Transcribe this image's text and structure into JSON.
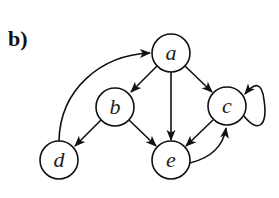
{
  "panel": {
    "label": "b)"
  },
  "graph": {
    "directed": true,
    "nodes": [
      {
        "id": "a",
        "label": "a",
        "x": 171,
        "y": 53
      },
      {
        "id": "b",
        "label": "b",
        "x": 115,
        "y": 107
      },
      {
        "id": "c",
        "label": "c",
        "x": 227,
        "y": 106
      },
      {
        "id": "d",
        "label": "d",
        "x": 59,
        "y": 160
      },
      {
        "id": "e",
        "label": "e",
        "x": 171,
        "y": 160
      }
    ],
    "edges": [
      {
        "from": "a",
        "to": "b"
      },
      {
        "from": "a",
        "to": "e"
      },
      {
        "from": "a",
        "to": "c"
      },
      {
        "from": "b",
        "to": "d"
      },
      {
        "from": "b",
        "to": "e"
      },
      {
        "from": "c",
        "to": "e"
      },
      {
        "from": "e",
        "to": "c"
      },
      {
        "from": "c",
        "to": "c"
      },
      {
        "from": "d",
        "to": "a"
      }
    ],
    "colors": {
      "stroke": "#111111",
      "fill": "#ffffff"
    }
  }
}
